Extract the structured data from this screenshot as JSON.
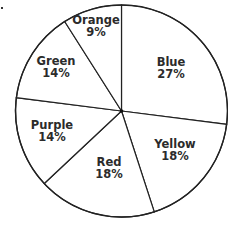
{
  "chart_data": {
    "type": "pie",
    "title": "",
    "start_angle_deg": -90,
    "direction": "clockwise",
    "fill": "#ffffff",
    "stroke": "#222222",
    "categories": [
      "Blue",
      "Yellow",
      "Red",
      "Purple",
      "Green",
      "Orange"
    ],
    "values": [
      27,
      18,
      18,
      14,
      14,
      9
    ],
    "labels": [
      {
        "name": "Blue",
        "pct": "27%",
        "x": 171,
        "y": 66
      },
      {
        "name": "Yellow",
        "pct": "18%",
        "x": 175,
        "y": 148
      },
      {
        "name": "Red",
        "pct": "18%",
        "x": 109,
        "y": 166
      },
      {
        "name": "Purple",
        "pct": "14%",
        "x": 52,
        "y": 129
      },
      {
        "name": "Green",
        "pct": "14%",
        "x": 56,
        "y": 65
      },
      {
        "name": "Orange",
        "pct": "9%",
        "x": 96,
        "y": 24
      }
    ],
    "center": [
      121.5,
      111
    ],
    "radius": 106,
    "legend": "none",
    "grid": false
  }
}
